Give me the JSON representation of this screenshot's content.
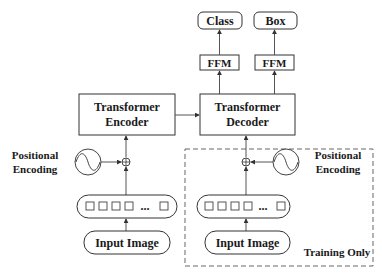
{
  "diagram": {
    "outputs": [
      {
        "label": "Class"
      },
      {
        "label": "Box"
      }
    ],
    "heads": [
      {
        "label": "FFM"
      },
      {
        "label": "FFM"
      }
    ],
    "encoder": {
      "line1": "Transformer",
      "line2": "Encoder"
    },
    "decoder": {
      "line1": "Transformer",
      "line2": "Decoder"
    },
    "positional_encoding_left": {
      "line1": "Positional",
      "line2": "Encoding"
    },
    "positional_encoding_right": {
      "line1": "Positional",
      "line2": "Encoding"
    },
    "token_sequence": {
      "ellipsis": "..."
    },
    "inputs": [
      {
        "label": "Input Image"
      },
      {
        "label": "Input Image"
      }
    ],
    "training_region": {
      "label": "Training Only"
    },
    "colors": {
      "stroke": "#333333",
      "background": "#ffffff",
      "text": "#1a1a1a"
    }
  }
}
